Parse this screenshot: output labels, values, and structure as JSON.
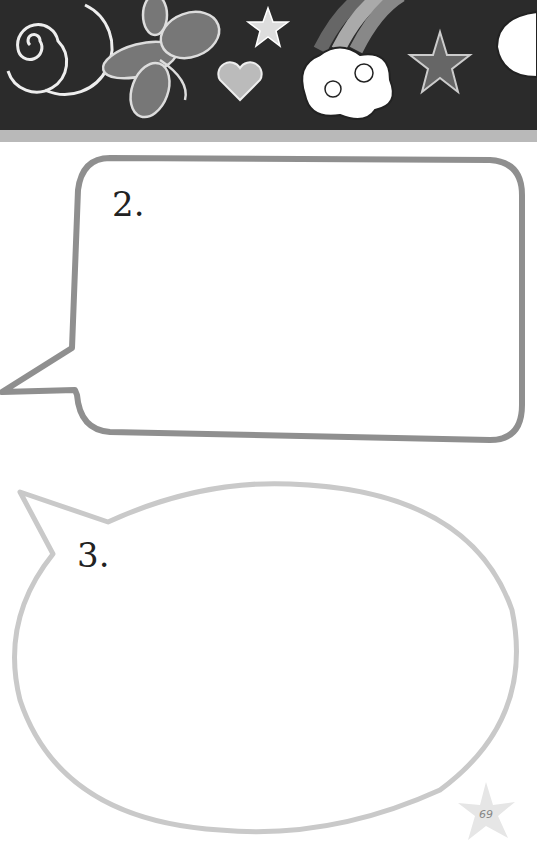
{
  "banner": {
    "icons": [
      "spiral-icon",
      "butterfly-icon",
      "star-icon",
      "heart-icon",
      "rainbow-icon",
      "cloud-icon",
      "star-icon",
      "cloud-icon"
    ],
    "background": "#2b2b2b"
  },
  "bubbles": [
    {
      "label": "2.",
      "shape": "rounded-rectangle",
      "stroke": "#8f8f8f"
    },
    {
      "label": "3.",
      "shape": "oval",
      "stroke": "#c9c9c9"
    }
  ],
  "page_number": "69"
}
